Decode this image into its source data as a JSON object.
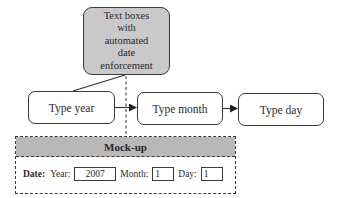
{
  "callout": {
    "lines": [
      "Text boxes",
      "with",
      "automated",
      "date",
      "enforcement"
    ],
    "fill": "#c9c9c9"
  },
  "flow": {
    "steps": [
      {
        "label": "Type year"
      },
      {
        "label": "Type month"
      },
      {
        "label": "Type day"
      }
    ]
  },
  "mockup": {
    "title": "Mock-up",
    "header_fill": "#b8b8b8",
    "date_label": "Date:",
    "year_label": "Year:",
    "year_value": "2007",
    "month_label": "Month:",
    "month_value": "1",
    "day_label": "Day:",
    "day_value": "1"
  }
}
